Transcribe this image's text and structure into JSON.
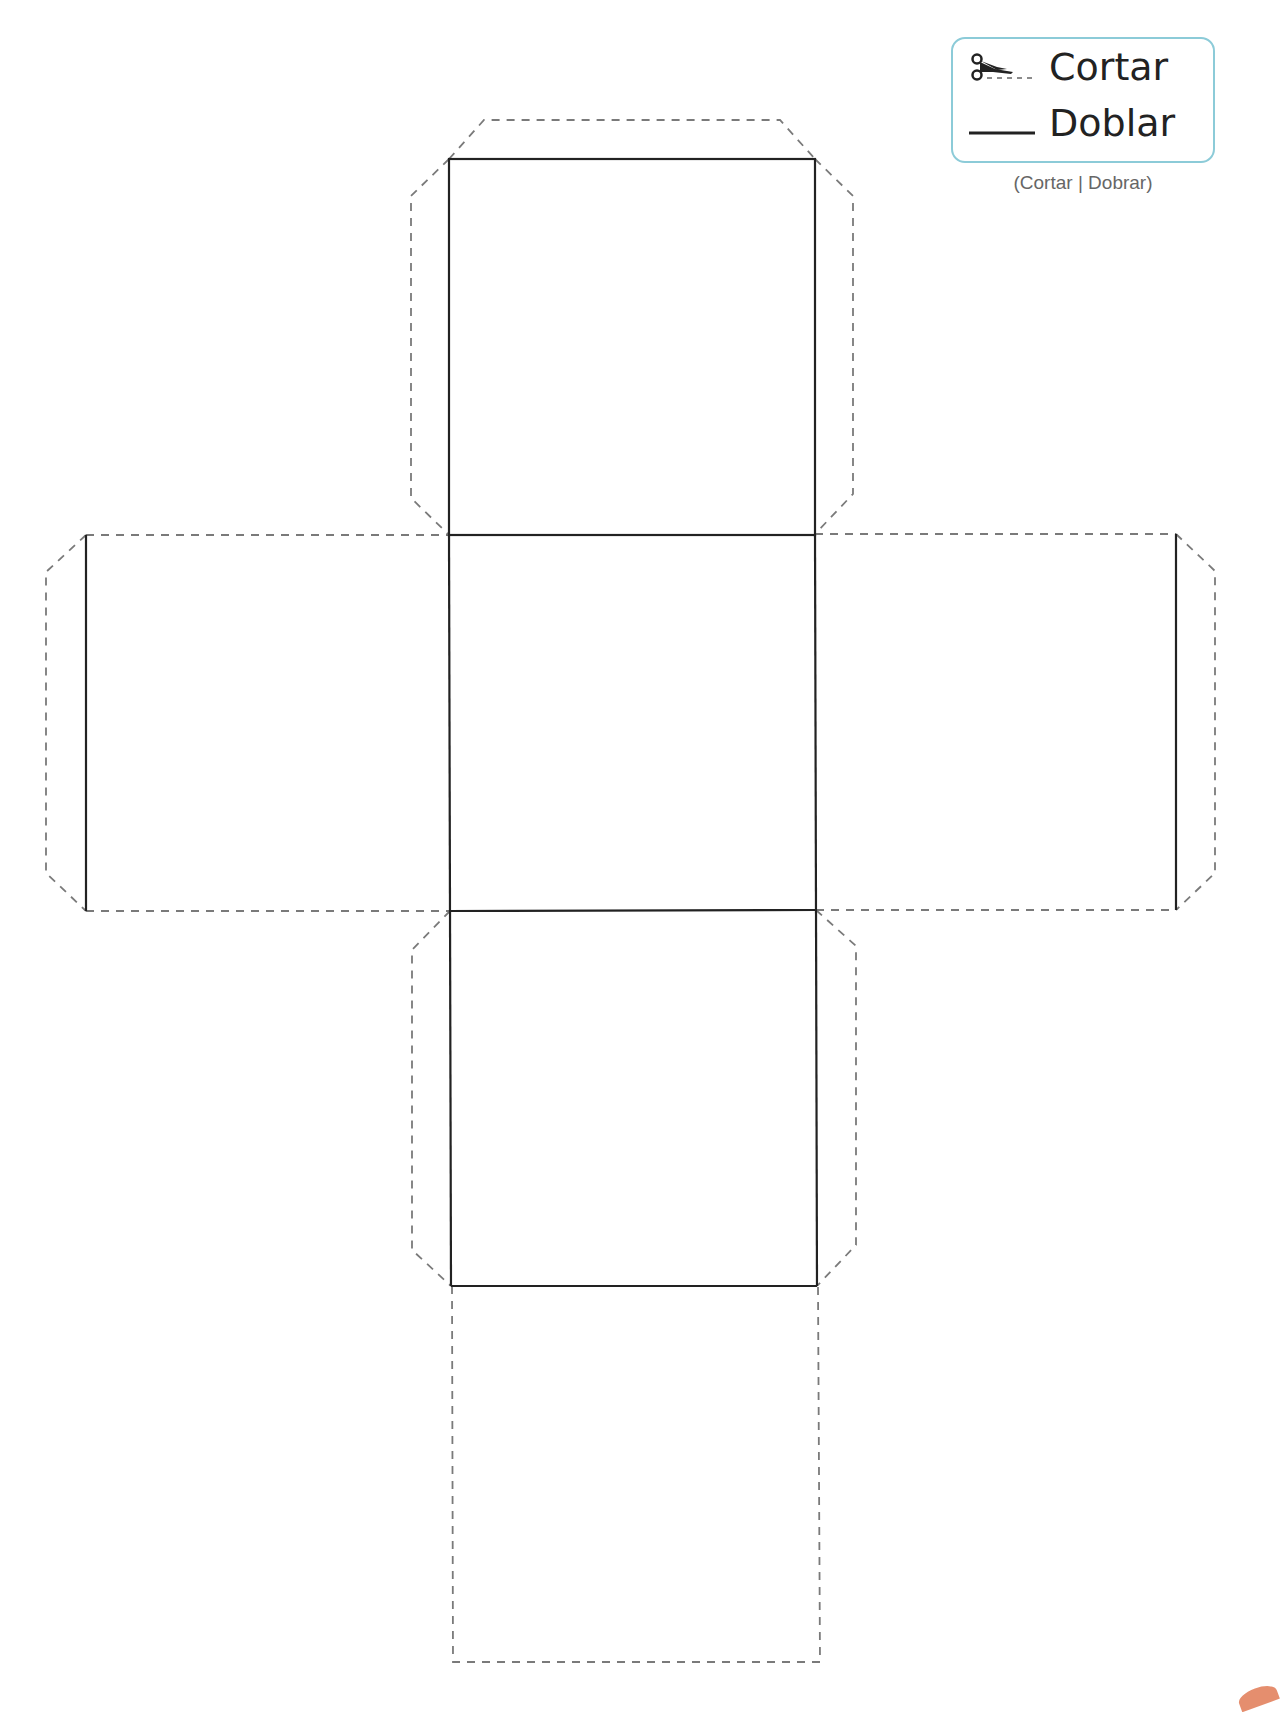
{
  "legend": {
    "cut_label": "Cortar",
    "fold_label": "Doblar",
    "caption": "(Cortar | Dobrar)",
    "cut_icon": "scissors-icon",
    "fold_icon": "solid-line-icon",
    "border_color": "#8ccbd8"
  },
  "net": {
    "type": "cube-net",
    "fold_line_style": "solid",
    "cut_line_style": "dashed",
    "line_color": "#222222",
    "cut_color": "#777777",
    "faces": [
      {
        "name": "top-face",
        "x": 449,
        "y": 159,
        "w": 366,
        "h": 376
      },
      {
        "name": "middle-face",
        "x": 449,
        "y": 535,
        "w": 366,
        "h": 376
      },
      {
        "name": "bottom-face",
        "x": 451,
        "y": 910,
        "w": 366,
        "h": 376
      },
      {
        "name": "left-face",
        "x": 86,
        "y": 535,
        "w": 363,
        "h": 376
      },
      {
        "name": "right-face",
        "x": 815,
        "y": 534,
        "w": 361,
        "h": 376
      },
      {
        "name": "bottom-extension-face",
        "x": 453,
        "y": 1286,
        "w": 367,
        "h": 376
      }
    ]
  }
}
